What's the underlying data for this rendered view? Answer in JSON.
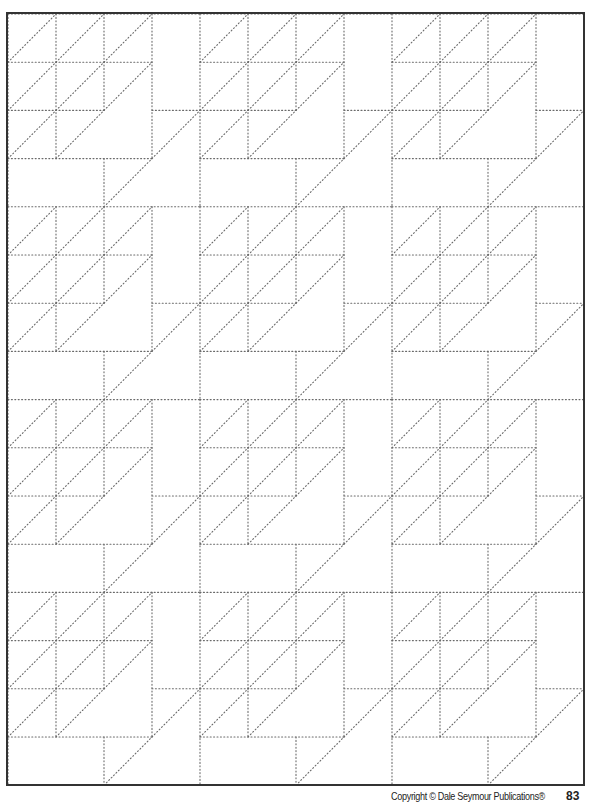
{
  "page": {
    "width": 591,
    "height": 807,
    "background": "#ffffff"
  },
  "worksheet": {
    "type": "quilt-pattern-grid",
    "frame": {
      "x": 7,
      "y": 13,
      "width": 577,
      "height": 772,
      "color": "#333333"
    },
    "grid": {
      "origin_x": 8,
      "origin_y": 14,
      "columns": 12,
      "rows": 16,
      "cell_width": 48,
      "cell_height": 48.2,
      "line_color": "#6a6a6a",
      "line_style": "dotted"
    },
    "tile": {
      "size_cols": 4,
      "size_rows": 4,
      "repeats_x": 3,
      "repeats_y": 4,
      "horizontals": [
        [
          0,
          0,
          4
        ],
        [
          1,
          0,
          3
        ],
        [
          2,
          0,
          2
        ],
        [
          2,
          3,
          4
        ],
        [
          3,
          0,
          3
        ]
      ],
      "verticals": [
        [
          0,
          0,
          4
        ],
        [
          1,
          0,
          3
        ],
        [
          2,
          0,
          2
        ],
        [
          2,
          3,
          4
        ],
        [
          3,
          0,
          3
        ]
      ],
      "diagonals": [
        [
          0,
          1,
          1,
          0
        ],
        [
          1,
          1,
          2,
          0
        ],
        [
          2,
          1,
          3,
          0
        ],
        [
          0,
          2,
          1,
          1
        ],
        [
          1,
          2,
          2,
          1
        ],
        [
          2,
          2,
          3,
          1
        ],
        [
          0,
          3,
          1,
          2
        ],
        [
          1,
          3,
          2,
          2
        ],
        [
          3,
          3,
          4,
          2
        ],
        [
          2,
          4,
          3,
          3
        ]
      ]
    }
  },
  "footer": {
    "copyright": "Copyright © Dale Seymour Publications®",
    "page_number": "83"
  }
}
